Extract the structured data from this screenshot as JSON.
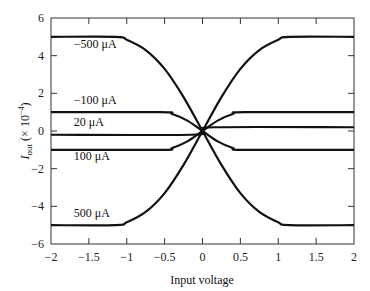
{
  "chart_data": {
    "type": "line",
    "title": "",
    "xlabel": "Input voltage",
    "ylabel": "I_out (× 10^-4)",
    "ylabel_parts": {
      "main": "I",
      "sub": "out",
      "rest": " (× 10",
      "sup": "−4",
      "close": ")"
    },
    "xlim": [
      -2,
      2
    ],
    "ylim": [
      -6,
      6
    ],
    "grid": false,
    "legend": "inline labels",
    "x_ticks": [
      -2,
      -1.5,
      -1,
      -0.5,
      0,
      0.5,
      1,
      1.5,
      2
    ],
    "x_tick_labels": [
      "−2",
      "−1.5",
      "−1",
      "−0.5",
      "0",
      "0.5",
      "1",
      "1.5",
      "2"
    ],
    "y_ticks": [
      -6,
      -4,
      -2,
      0,
      2,
      4,
      6
    ],
    "y_tick_labels": [
      "−6",
      "−4",
      "−2",
      "0",
      "2",
      "4",
      "6"
    ],
    "series": [
      {
        "name": "−500 μA",
        "label_pos": [
          -1.7,
          4.4
        ],
        "x": [
          -2,
          -1.15,
          -1.0,
          -0.75,
          -0.5,
          -0.25,
          0,
          0.25,
          0.5,
          0.75,
          1.0,
          1.15,
          2
        ],
        "y": [
          5,
          5,
          4.85,
          4.3,
          3.3,
          1.8,
          0,
          -1.8,
          -3.3,
          -4.3,
          -4.85,
          -5,
          -5
        ]
      },
      {
        "name": "−100 μA",
        "label_pos": [
          -1.7,
          1.45
        ],
        "x": [
          -2,
          -0.55,
          -0.4,
          -0.2,
          0,
          0.2,
          0.4,
          0.55,
          2
        ],
        "y": [
          1,
          1,
          0.9,
          0.55,
          0,
          -0.55,
          -0.9,
          -1,
          -1
        ]
      },
      {
        "name": "20 μA",
        "label_pos": [
          -1.7,
          0.25
        ],
        "x": [
          -2,
          -0.15,
          0,
          0.15,
          2
        ],
        "y": [
          -0.2,
          -0.2,
          0,
          0.2,
          0.2
        ]
      },
      {
        "name": "100 μA",
        "label_pos": [
          -1.7,
          -1.55
        ],
        "x": [
          -2,
          -0.55,
          -0.4,
          -0.2,
          0,
          0.2,
          0.4,
          0.55,
          2
        ],
        "y": [
          -1,
          -1,
          -0.9,
          -0.55,
          0,
          0.55,
          0.9,
          1,
          1
        ]
      },
      {
        "name": "500 μA",
        "label_pos": [
          -1.7,
          -4.55
        ],
        "x": [
          -2,
          -1.15,
          -1.0,
          -0.75,
          -0.5,
          -0.25,
          0,
          0.25,
          0.5,
          0.75,
          1.0,
          1.15,
          2
        ],
        "y": [
          -5,
          -5,
          -4.85,
          -4.3,
          -3.3,
          -1.8,
          0,
          1.8,
          3.3,
          4.3,
          4.85,
          5,
          5
        ]
      }
    ],
    "colors": {
      "line": "#111111",
      "frame": "#333333",
      "background": "#ffffff"
    }
  }
}
